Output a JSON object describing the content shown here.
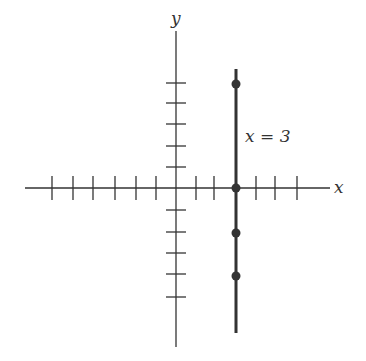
{
  "diagram": {
    "type": "coordinate-plane",
    "axes": {
      "x_label": "x",
      "y_label": "y",
      "x_ticks": [
        -6,
        -5,
        -4,
        -3,
        -2,
        -1,
        1,
        2,
        3,
        4,
        5,
        6
      ],
      "y_ticks": [
        5,
        4,
        3,
        2,
        1,
        -1,
        -2,
        -3,
        -4,
        -5
      ]
    },
    "line": {
      "equation_label": "x = 3",
      "x_value": 3,
      "color": "#333333"
    },
    "points": [
      {
        "x": 3,
        "y": 5
      },
      {
        "x": 3,
        "y": 0
      },
      {
        "x": 3,
        "y": -2
      },
      {
        "x": 3,
        "y": -4
      }
    ]
  }
}
